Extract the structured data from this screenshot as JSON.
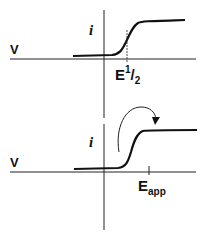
{
  "top_panel": {
    "x_axis_label": "V",
    "y_axis_label": "i",
    "marker_label": {
      "base": "E",
      "sup": "1",
      "slash": "/",
      "sub": "2"
    }
  },
  "bottom_panel": {
    "x_axis_label": "V",
    "y_axis_label": "i",
    "marker_label": {
      "base": "E",
      "sub": "app"
    }
  },
  "colors": {
    "line": "#111111",
    "background": "#ffffff"
  }
}
